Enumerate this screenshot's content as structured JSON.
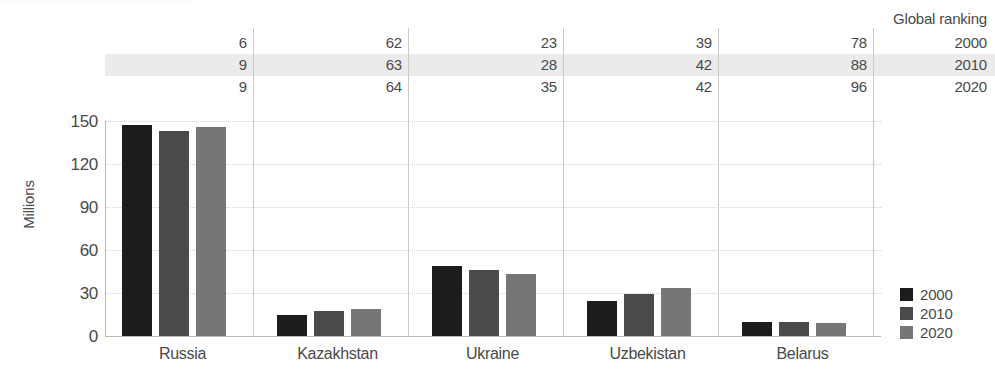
{
  "chart_data": {
    "type": "bar",
    "title": "",
    "xlabel": "",
    "ylabel": "Millions",
    "ylim": [
      0,
      150
    ],
    "yticks": [
      0,
      30,
      60,
      90,
      120,
      150
    ],
    "grid": true,
    "legend_position": "right",
    "categories": [
      "Russia",
      "Kazakhstan",
      "Ukraine",
      "Uzbekistan",
      "Belarus"
    ],
    "series": [
      {
        "name": "2000",
        "color": "#1c1c1c",
        "values": [
          147,
          15,
          49,
          24.5,
          10
        ]
      },
      {
        "name": "2010",
        "color": "#4a4a4a",
        "values": [
          143,
          17.5,
          46,
          29,
          9.7
        ]
      },
      {
        "name": "2020",
        "color": "#767676",
        "values": [
          146,
          19,
          43.5,
          33.5,
          9.4
        ]
      }
    ],
    "annotation_table": {
      "header": "Global ranking",
      "row_labels": [
        "2000",
        "2010",
        "2020"
      ],
      "highlighted_row": "2010",
      "columns": [
        "Russia",
        "Kazakhstan",
        "Ukraine",
        "Uzbekistan",
        "Belarus"
      ],
      "rows": [
        {
          "year": "2000",
          "values": [
            "6",
            "62",
            "23",
            "39",
            "78"
          ]
        },
        {
          "year": "2010",
          "values": [
            "9",
            "63",
            "28",
            "42",
            "88"
          ]
        },
        {
          "year": "2020",
          "values": [
            "9",
            "64",
            "35",
            "42",
            "96"
          ]
        }
      ]
    }
  },
  "axis": {
    "y_title": "Millions",
    "y_tick_labels": [
      "150",
      "120",
      "90",
      "60",
      "30",
      "0"
    ],
    "x_tick_labels": [
      "Russia",
      "Kazakhstan",
      "Ukraine",
      "Uzbekistan",
      "Belarus"
    ]
  },
  "table": {
    "header": "Global ranking",
    "row_years": [
      "2000",
      "2010",
      "2020"
    ],
    "cells": [
      [
        "6",
        "62",
        "23",
        "39",
        "78"
      ],
      [
        "9",
        "63",
        "28",
        "42",
        "88"
      ],
      [
        "9",
        "64",
        "35",
        "42",
        "96"
      ]
    ]
  },
  "legend": {
    "items": [
      {
        "label": "2000",
        "color": "#1c1c1c"
      },
      {
        "label": "2010",
        "color": "#4a4a4a"
      },
      {
        "label": "2020",
        "color": "#767676"
      }
    ]
  },
  "colors": {
    "series_2000": "#1c1c1c",
    "series_2010": "#4a4a4a",
    "series_2020": "#767676",
    "band": "#ebebeb",
    "gridline": "#d2d2d2",
    "axis": "#b9b9b9",
    "text": "#4a4a4a"
  }
}
